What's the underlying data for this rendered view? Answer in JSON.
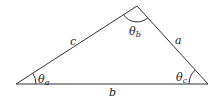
{
  "diagram": {
    "type": "triangle",
    "vertices": {
      "A": [
        16,
        84
      ],
      "B": [
        137,
        6
      ],
      "C": [
        208,
        84
      ]
    },
    "sides": {
      "a": "a",
      "b": "b",
      "c": "c"
    },
    "angles": {
      "theta_a": "θ",
      "theta_a_sub": "a",
      "theta_b": "θ",
      "theta_b_sub": "b",
      "theta_c": "θ",
      "theta_c_sub": "c"
    },
    "stroke_color": "#333333"
  }
}
